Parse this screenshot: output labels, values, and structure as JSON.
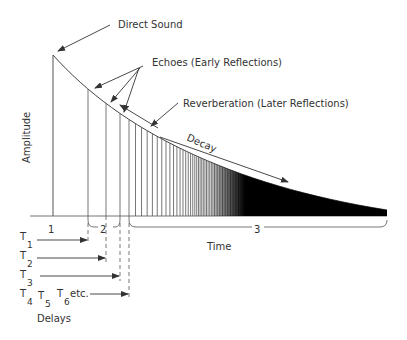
{
  "diagram": {
    "colors": {
      "line": "#444444",
      "text": "#333333",
      "fill": "#000000",
      "background": "#ffffff"
    },
    "axis": {
      "y_label": "Amplitude",
      "x_label": "Time"
    },
    "labels": {
      "direct_sound": "Direct Sound",
      "echoes": "Echoes (Early Reflections)",
      "reverberation": "Reverberation (Later Reflections)",
      "decay": "Decay"
    },
    "regions": [
      {
        "id": "1",
        "label": "1"
      },
      {
        "id": "2",
        "label": "2"
      },
      {
        "id": "3",
        "label": "3"
      }
    ],
    "delays": {
      "title": "Delays",
      "items": [
        {
          "label": "T",
          "sub": "1"
        },
        {
          "label": "T",
          "sub": "2"
        },
        {
          "label": "T",
          "sub": "3"
        },
        {
          "label": "T",
          "sub": "4"
        },
        {
          "label": "T",
          "sub": "5"
        },
        {
          "label": "T",
          "sub": "6"
        }
      ],
      "etc": "etc."
    }
  }
}
